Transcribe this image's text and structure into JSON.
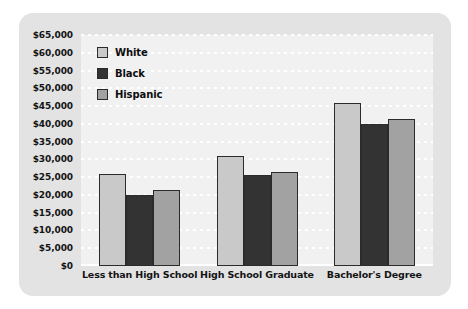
{
  "chart_data": {
    "type": "bar",
    "title": "",
    "subtitle": "",
    "xlabel": "",
    "ylabel": "",
    "grid": true,
    "legend_position": "top-left",
    "categories": [
      "Less than High School",
      "High School Graduate",
      "Bachelor's Degree"
    ],
    "series": [
      {
        "name": "White",
        "color": "#c9c9c9",
        "values": [
          26000,
          31000,
          46000
        ]
      },
      {
        "name": "Black",
        "color": "#333333",
        "values": [
          20000,
          25700,
          40000
        ]
      },
      {
        "name": "Hispanic",
        "color": "#a2a2a2",
        "values": [
          21500,
          26500,
          41500
        ]
      }
    ],
    "ylim": [
      0,
      65000
    ],
    "ytick_step": 5000,
    "ytick_labels": [
      "$65,000",
      "$60,000",
      "$55,000",
      "$50,000",
      "$45,000",
      "$40,000",
      "$35,000",
      "$30,000",
      "$25,000",
      "$20,000",
      "$15,000",
      "$10,000",
      "$5,000",
      "$0"
    ],
    "ytick_values": [
      65000,
      60000,
      55000,
      50000,
      45000,
      40000,
      35000,
      30000,
      25000,
      20000,
      15000,
      10000,
      5000,
      0
    ]
  },
  "colors": {
    "panel_background": "#e3e3e3",
    "plot_background": "#f1f1f1",
    "gridline": "#ffffff",
    "bar_outline": "#2b2b2b",
    "text": "#141414"
  }
}
